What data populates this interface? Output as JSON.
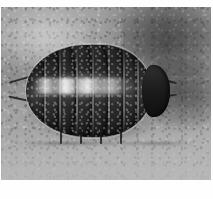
{
  "figure": {
    "alt_description": "Grayscale photograph of a woodlouse (pill bug) on stony ground",
    "scene": "stony soil background",
    "color_mode": "grayscale",
    "segment_count": 8,
    "body_orientation": "head to the right"
  },
  "caption": {
    "text": ""
  },
  "colors": {
    "page_background": "#ffffff",
    "photo_background_light": "#b4b1a8",
    "photo_background_dark": "#5f5e5b",
    "subject_dark": "#1d1b18",
    "subject_highlight": "#ffffff",
    "subject_rim": "#cecac0"
  }
}
